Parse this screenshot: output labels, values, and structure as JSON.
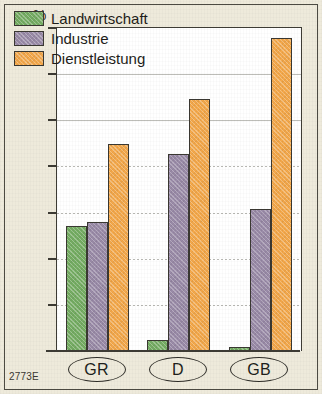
{
  "figure": {
    "unit_label": "%",
    "source_code": "2773E",
    "background_color": "#eeeadb",
    "plot_background": "#ffffff",
    "frame_color": "#4c4a42"
  },
  "legend": {
    "position": "top-left-inside",
    "items": [
      {
        "label": "Landwirtschaft",
        "color": "#75ad63",
        "swatch_name": "legend-swatch-landwirtschaft"
      },
      {
        "label": "Industrie",
        "color": "#9a8ba8",
        "swatch_name": "legend-swatch-industrie"
      },
      {
        "label": "Dienstleistung",
        "color": "#f4a84a",
        "swatch_name": "legend-swatch-dienstleistung"
      }
    ]
  },
  "chart_data": {
    "type": "bar",
    "title": "",
    "subtitle": "",
    "xlabel": "",
    "ylabel": "%",
    "ylim": [
      0,
      70
    ],
    "yticks": [
      0,
      10,
      20,
      30,
      40,
      50,
      60,
      70
    ],
    "ytick_labels": [
      "0",
      "10",
      "20",
      "30",
      "40",
      "50",
      "60",
      "70"
    ],
    "grid": true,
    "grid_axis": "y",
    "legend_position": "upper left",
    "categories": [
      "GR",
      "D",
      "GB"
    ],
    "series": [
      {
        "name": "Landwirtschaft",
        "color": "#75ad63",
        "values": [
          27.0,
          2.3,
          0.8
        ]
      },
      {
        "name": "Industrie",
        "color": "#9a8ba8",
        "values": [
          28.0,
          42.8,
          30.8
        ]
      },
      {
        "name": "Dienstleistung",
        "color": "#f4a84a",
        "values": [
          44.8,
          54.6,
          67.8
        ]
      }
    ],
    "annotations": [
      "2773E"
    ]
  }
}
